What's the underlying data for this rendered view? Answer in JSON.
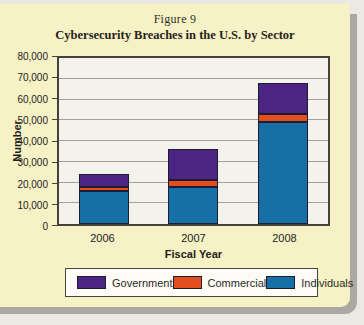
{
  "figure": {
    "label": "Figure 9",
    "title": "Cybersecurity Breaches in the U.S. by Sector"
  },
  "chart_data": {
    "type": "bar",
    "stacked": true,
    "title": "Cybersecurity Breaches in the U.S. by Sector",
    "figure_label": "Figure 9",
    "categories": [
      "2006",
      "2007",
      "2008"
    ],
    "series": [
      {
        "name": "Government",
        "color": "#4b2484",
        "values": [
          6000,
          15000,
          15000
        ]
      },
      {
        "name": "Commercial",
        "color": "#e24e1e",
        "values": [
          2000,
          3000,
          4000
        ]
      },
      {
        "name": "Individuals",
        "color": "#1670a6",
        "values": [
          16000,
          18000,
          49000
        ]
      }
    ],
    "stack_order_bottom_to_top": [
      "Individuals",
      "Commercial",
      "Government"
    ],
    "totals": [
      24000,
      36000,
      68000
    ],
    "xlabel": "Fiscal Year",
    "ylabel": "Number",
    "ylim": [
      0,
      80000
    ],
    "ytick_step": 10000,
    "ytick_labels": [
      "0",
      "10,000",
      "20,000",
      "30,000",
      "40,000",
      "50,000",
      "60,000",
      "70,000",
      "80,000"
    ],
    "grid": "horizontal",
    "legend_position": "bottom"
  },
  "colors": {
    "panel_background": "#f6f2c5",
    "panel_shadow": "#a9a8a1",
    "page_background": "#ebe9e1",
    "plot_background": "#f3f2eb",
    "gridline": "#a3a29a",
    "government": "#4b2484",
    "commercial": "#e24e1e",
    "individuals": "#1670a6"
  }
}
